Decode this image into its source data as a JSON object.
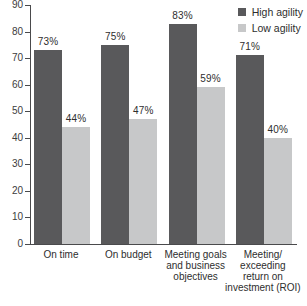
{
  "chart_data": {
    "type": "bar",
    "title": "",
    "categories": [
      "On time",
      "On budget",
      "Meeting goals and business objectives",
      "Meeting/exceeding return on investment (ROI)"
    ],
    "category_lines": [
      [
        "On time"
      ],
      [
        "On budget"
      ],
      [
        "Meeting goals",
        "and business",
        "objectives"
      ],
      [
        "Meeting/",
        "exceeding",
        "return on",
        "investment (ROI)"
      ]
    ],
    "series": [
      {
        "name": "High agility",
        "color": "#59595b",
        "values": [
          73,
          75,
          83,
          71
        ]
      },
      {
        "name": "Low agility",
        "color": "#c7c8c9",
        "values": [
          44,
          47,
          59,
          40
        ]
      }
    ],
    "value_suffix": "%",
    "ylim": [
      0,
      90
    ],
    "ytick_step": 10,
    "ytick_labels": [
      "90",
      "80",
      "70",
      "60",
      "50",
      "40",
      "30",
      "20",
      "10",
      "0"
    ],
    "grid": false,
    "legend_position": "top-right",
    "axis_color": "#4a4a4c",
    "text_color": "#2e2e2e"
  }
}
